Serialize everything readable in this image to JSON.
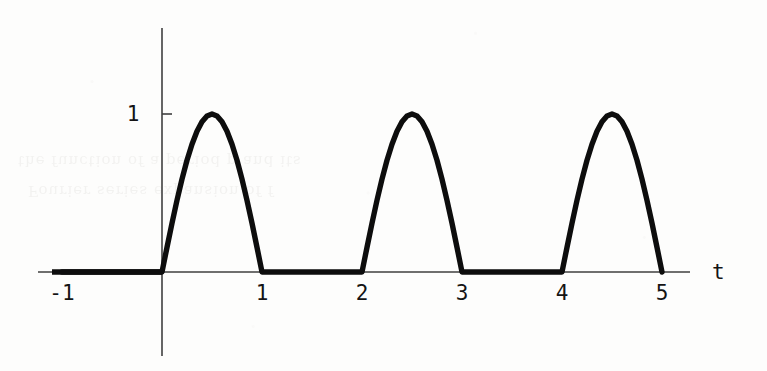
{
  "figure": {
    "background_color": "#fdfdfc",
    "ink_color": "#111111",
    "axis_color": "#3a3a3a",
    "curve_color": "#0d0d0d",
    "scan_artifact_lines": [
      "the function of a period p and its",
      "Fourier series expansion of f"
    ]
  },
  "chart_data": {
    "type": "line",
    "title": "",
    "subtitle": "",
    "xlabel": "t",
    "ylabel": "",
    "xlim": [
      -1.25,
      5.4
    ],
    "ylim": [
      -0.55,
      1.55
    ],
    "grid": false,
    "legend": null,
    "legend_position": "none",
    "x_ticks": [
      -1,
      1,
      2,
      3,
      4,
      5
    ],
    "x_tick_labels": [
      "-1",
      "1",
      "2",
      "3",
      "4",
      "5"
    ],
    "y_ticks": [
      1
    ],
    "y_tick_labels": [
      "1"
    ],
    "axis_labels": {
      "x": "t",
      "y": ""
    },
    "peak_value": 1,
    "period": 2,
    "arches": [
      {
        "start": 0,
        "end": 1,
        "peak_t": 0.5,
        "peak_value": 1
      },
      {
        "start": 2,
        "end": 3,
        "peak_t": 2.5,
        "peak_value": 1
      },
      {
        "start": 4,
        "end": 5,
        "peak_t": 4.5,
        "peak_value": 1
      }
    ],
    "zero_segments": [
      {
        "start": -1,
        "end": 0
      },
      {
        "start": 1,
        "end": 2
      },
      {
        "start": 3,
        "end": 4
      }
    ],
    "series": [
      {
        "name": "f(t)",
        "x": [
          -1.0,
          -0.9,
          -0.8,
          -0.7,
          -0.6,
          -0.5,
          -0.4,
          -0.3,
          -0.2,
          -0.1,
          0.0,
          0.05,
          0.1,
          0.15,
          0.2,
          0.25,
          0.3,
          0.35,
          0.4,
          0.45,
          0.5,
          0.55,
          0.6,
          0.65,
          0.7,
          0.75,
          0.8,
          0.85,
          0.9,
          0.95,
          1.0,
          1.2,
          1.4,
          1.6,
          1.8,
          2.0,
          2.05,
          2.1,
          2.15,
          2.2,
          2.25,
          2.3,
          2.35,
          2.4,
          2.45,
          2.5,
          2.55,
          2.6,
          2.65,
          2.7,
          2.75,
          2.8,
          2.85,
          2.9,
          2.95,
          3.0,
          3.2,
          3.4,
          3.6,
          3.8,
          4.0,
          4.05,
          4.1,
          4.15,
          4.2,
          4.25,
          4.3,
          4.35,
          4.4,
          4.45,
          4.5,
          4.55,
          4.6,
          4.65,
          4.7,
          4.75,
          4.8,
          4.85,
          4.9,
          4.95,
          5.0
        ],
        "y": [
          0,
          0,
          0,
          0,
          0,
          0,
          0,
          0,
          0,
          0,
          0.0,
          0.156,
          0.309,
          0.454,
          0.588,
          0.707,
          0.809,
          0.891,
          0.951,
          0.988,
          1.0,
          0.988,
          0.951,
          0.891,
          0.809,
          0.707,
          0.588,
          0.454,
          0.309,
          0.156,
          0.0,
          0,
          0,
          0,
          0,
          0.0,
          0.156,
          0.309,
          0.454,
          0.588,
          0.707,
          0.809,
          0.891,
          0.951,
          0.988,
          1.0,
          0.988,
          0.951,
          0.891,
          0.809,
          0.707,
          0.588,
          0.454,
          0.309,
          0.156,
          0.0,
          0,
          0,
          0,
          0,
          0.0,
          0.156,
          0.309,
          0.454,
          0.588,
          0.707,
          0.809,
          0.891,
          0.951,
          0.988,
          1.0,
          0.988,
          0.951,
          0.891,
          0.809,
          0.707,
          0.588,
          0.454,
          0.309,
          0.156,
          0.0
        ]
      }
    ]
  },
  "labels": {
    "x_minus1": "-1",
    "x_1": "1",
    "x_2": "2",
    "x_3": "3",
    "x_4": "4",
    "x_5": "5",
    "y_1": "1",
    "t_axis": "t"
  }
}
